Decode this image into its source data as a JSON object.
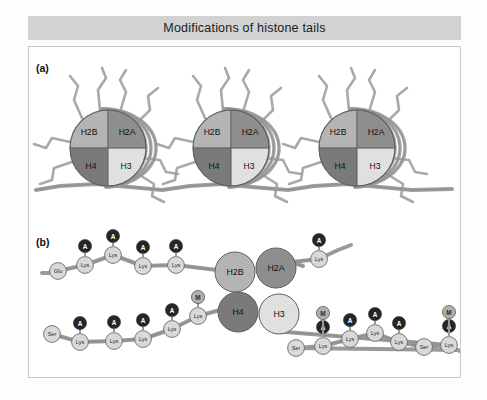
{
  "figure": {
    "title": "Modifications of histone tails",
    "panel_a_label": "(a)",
    "panel_b_label": "(b)"
  },
  "colors": {
    "title_bar": "#d2d2d2",
    "panel_bg": "#ffffff",
    "panel_border": "#c8c8c8",
    "h2b": "#b4b4b4",
    "h2a": "#8e8e8e",
    "h4": "#7a7a7a",
    "h3": "#e0e0e0",
    "dna": "#9a9a9a",
    "tail": "#9a9a9a",
    "residue_fill": "#d9d9d9",
    "acetyl_fill": "#252525",
    "methyl_fill": "#b0b0b0"
  },
  "panel_a": {
    "nucleosome_labels": [
      "H2B",
      "H2A",
      "H4",
      "H3"
    ],
    "nucleosome_count": 3,
    "quadrants": {
      "top_left": "H2B",
      "top_right": "H2A",
      "bottom_left": "H4",
      "bottom_right": "H3"
    }
  },
  "panel_b": {
    "core_labels": {
      "top_left": "H2B",
      "top_right": "H2A",
      "bottom_left": "H4",
      "bottom_right": "H3"
    },
    "marker_legend": {
      "acetylation": "A",
      "methylation": "M"
    },
    "tails": [
      {
        "name": "h2b-tail",
        "histone": "H2B",
        "residues": [
          {
            "label": "Glu",
            "marks": []
          },
          {
            "label": "Lys",
            "marks": [
              "A"
            ]
          },
          {
            "label": "Lys",
            "marks": [
              "A"
            ]
          },
          {
            "label": "Lys",
            "marks": [
              "A"
            ]
          },
          {
            "label": "Lys",
            "marks": [
              "A"
            ]
          }
        ]
      },
      {
        "name": "h2a-tail",
        "histone": "H2A",
        "residues": [
          {
            "label": "Lys",
            "marks": [
              "A"
            ]
          }
        ]
      },
      {
        "name": "h4-tail",
        "histone": "H4",
        "residues": [
          {
            "label": "Ser",
            "marks": []
          },
          {
            "label": "Lys",
            "marks": [
              "A"
            ]
          },
          {
            "label": "Lys",
            "marks": [
              "A"
            ]
          },
          {
            "label": "Lys",
            "marks": [
              "A"
            ]
          },
          {
            "label": "Lys",
            "marks": [
              "A"
            ]
          },
          {
            "label": "Lys",
            "marks": [
              "M"
            ]
          }
        ]
      },
      {
        "name": "h3-tail",
        "histone": "H3",
        "residues": [
          {
            "label": "Ser",
            "marks": []
          },
          {
            "label": "Lys",
            "marks": [
              "M",
              "A"
            ]
          },
          {
            "label": "Lys",
            "marks": [
              "A"
            ]
          },
          {
            "label": "Lys",
            "marks": [
              "A"
            ]
          },
          {
            "label": "Lys",
            "marks": [
              "A"
            ]
          },
          {
            "label": "Ser",
            "marks": []
          },
          {
            "label": "Lys",
            "marks": [
              "M",
              "A"
            ]
          }
        ]
      }
    ]
  }
}
